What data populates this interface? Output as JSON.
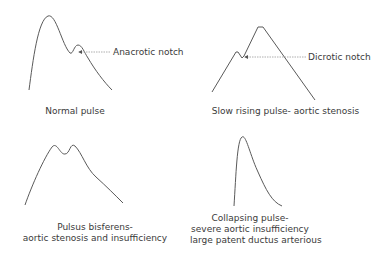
{
  "panels": [
    {
      "id": "normal",
      "caption": [
        "Normal pulse"
      ],
      "annotation": "Anacrotic notch",
      "curve": "M29,90 C33,60 38,20 48,16 C56,13 62,45 70,53 C73,55 74,45 78,45 C82,45 84,52 88,58 C95,70 104,82 112,90",
      "arrow": {
        "from": [
          110,
          52
        ],
        "to": [
          79,
          52
        ]
      }
    },
    {
      "id": "slow-rising",
      "caption": [
        "Slow rising pulse- aortic stenosis"
      ],
      "annotation": "Dicrotic notch",
      "curve": "M212,92 L236,52 L238,52 L242,58 L244,56 L258,27 L263,27 L315,100",
      "arrow": {
        "from": [
          306,
          57
        ],
        "to": [
          245,
          57
        ]
      }
    },
    {
      "id": "bisferiens",
      "caption": [
        "Pulsus bisferens-",
        "aortic stenosis and insufficiency"
      ],
      "annotation": "",
      "curve": "M25,205 C32,185 44,158 52,147 C57,141 60,155 65,154 C70,154 70,142 75,146 C82,153 86,168 96,177 C106,186 115,195 123,203",
      "arrow": null
    },
    {
      "id": "collapsing",
      "caption": [
        "Collapsing pulse-",
        "severe aortic insufficiency",
        "large patent ductus arterious"
      ],
      "annotation": "",
      "curve": "M234,206 C236,175 237,140 242,137 C246,134 250,155 258,172 C266,190 272,202 282,206",
      "arrow": null
    }
  ],
  "colors": {
    "curve": "#5a5a5a",
    "arrow": "#8a8a8a",
    "text": "#3a3a3a"
  }
}
